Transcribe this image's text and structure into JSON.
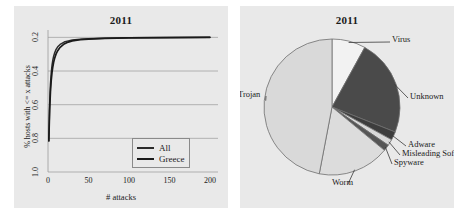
{
  "figure": {
    "panels": [
      {
        "id": "cdf",
        "title": "2011"
      },
      {
        "id": "pie",
        "title": "2011"
      }
    ]
  },
  "chart_data": [
    {
      "type": "line",
      "title": "2011",
      "xlabel": "# attacks",
      "ylabel": "% hosts with <= x attacks",
      "xlim": [
        0,
        210
      ],
      "ylim": [
        0.2,
        1.02
      ],
      "xticks": [
        0,
        50,
        100,
        150,
        200
      ],
      "yticks": [
        "0.2",
        "0.4",
        "0.6",
        "0.8",
        "1.0"
      ],
      "grid": true,
      "legend_position": "bottom-right",
      "series": [
        {
          "name": "All",
          "color": "#2b2b2b",
          "x": [
            1,
            2,
            3,
            4,
            5,
            6,
            7,
            8,
            10,
            12,
            15,
            20,
            25,
            30,
            40,
            50,
            70,
            100,
            150,
            200
          ],
          "y": [
            0.385,
            0.6,
            0.72,
            0.79,
            0.835,
            0.866,
            0.888,
            0.905,
            0.929,
            0.944,
            0.958,
            0.972,
            0.979,
            0.984,
            0.989,
            0.992,
            0.995,
            0.997,
            0.999,
            1.0
          ]
        },
        {
          "name": "Greece",
          "color": "#1a1a1a",
          "x": [
            1,
            2,
            3,
            4,
            5,
            6,
            7,
            8,
            10,
            12,
            15,
            20,
            25,
            30,
            40,
            50,
            70,
            100,
            150,
            200
          ],
          "y": [
            0.385,
            0.565,
            0.675,
            0.745,
            0.793,
            0.827,
            0.853,
            0.873,
            0.902,
            0.921,
            0.941,
            0.961,
            0.972,
            0.979,
            0.986,
            0.99,
            0.994,
            0.997,
            0.999,
            1.0
          ]
        }
      ]
    },
    {
      "type": "pie",
      "title": "2011",
      "start_angle_deg": -90,
      "direction": "clockwise",
      "labels": [
        "Virus",
        "Unknown",
        "Adware",
        "Misleading Software",
        "Spyware",
        "Worm",
        "Trojan"
      ],
      "values": [
        8.0,
        23.0,
        2.0,
        1.5,
        1.5,
        17.0,
        47.0
      ],
      "colors": [
        "#f2f2f2",
        "#4a4a4a",
        "#3d3d3d",
        "#d8d8d8",
        "#555555",
        "#dcdcdc",
        "#d9d9d9"
      ]
    }
  ]
}
